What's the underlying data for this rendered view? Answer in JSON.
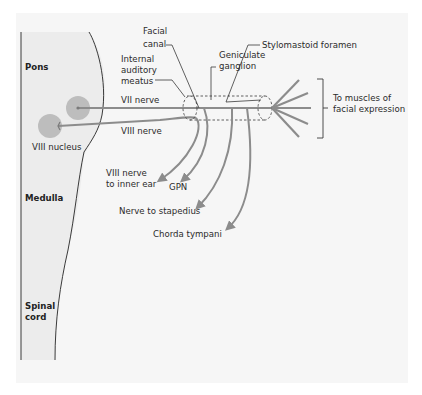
{
  "colors": {
    "panel_bg": "#f6f6f6",
    "brainstem_bg": "#ececec",
    "nerve": "#8c8c8c",
    "nucleus": "#bdbdbd",
    "outline": "#3a3a3a",
    "text": "#2b2b2b"
  },
  "regions": {
    "pons": "Pons",
    "medulla": "Medulla",
    "spinal_cord_line1": "Spinal",
    "spinal_cord_line2": "cord"
  },
  "labels": {
    "facial_canal_1": "Facial",
    "facial_canal_2": "canal",
    "internal_auditory_meatus_1": "Internal",
    "internal_auditory_meatus_2": "auditory",
    "internal_auditory_meatus_3": "meatus",
    "geniculate_ganglion_1": "Geniculate",
    "geniculate_ganglion_2": "ganglion",
    "stylomastoid_foramen": "Stylomastoid foramen",
    "vii_nerve": "VII nerve",
    "viii_nerve": "VIII nerve",
    "viii_nucleus": "VIII nucleus",
    "muscles_1": "To muscles of",
    "muscles_2": "facial expression",
    "viii_inner_ear_1": "VIII nerve",
    "viii_inner_ear_2": "to inner ear",
    "gpn": "GPN",
    "nerve_to_stapedius": "Nerve to stapedius",
    "chorda_tympani": "Chorda tympani"
  }
}
